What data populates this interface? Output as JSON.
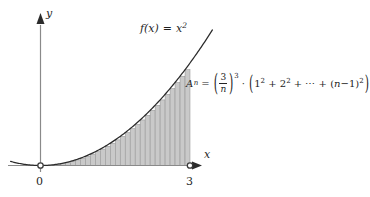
{
  "figure": {
    "background": "#ffffff",
    "axes": {
      "x_axis_label": "x",
      "y_axis_label": "y",
      "origin_label": "0",
      "right_tick_label": "3",
      "axis_color": "#8a8a8a",
      "tick_marker_style": "open-circle"
    },
    "curve": {
      "function_label_f": "f(x)",
      "function_label_eq": "=",
      "function_label_expr": "x",
      "function_label_exp": "2",
      "function_label_full": "f(x) = x²",
      "color": "#2a2a2a"
    },
    "riemann": {
      "fill_color": "#c9c9c9",
      "edge_color": "#8e8e8e",
      "rule": "left-endpoint",
      "bar_count": 30
    },
    "formula": {
      "lhs_var": "A",
      "lhs_sub": "n",
      "equals": "=",
      "frac_numerator": "3",
      "frac_denominator": "n",
      "frac_exponent": "3",
      "multiply_dot": "·",
      "term1_base": "1",
      "term1_exp": "2",
      "plus1": "+",
      "term2_base": "2",
      "term2_exp": "2",
      "plus2": "+",
      "ellipsis": "⋯",
      "plus3": "+",
      "term3_open": "(",
      "term3_var": "n",
      "term3_minus": "−",
      "term3_one": "1",
      "term3_close": ")",
      "term3_exp": "2",
      "full_text": "A_n = (3/n)^3 · (1² + 2² + ⋯ + (n−1)²)"
    }
  },
  "chart_data": {
    "type": "area",
    "title": "",
    "subtitle": "",
    "xlabel": "x",
    "ylabel": "y",
    "function": "f(x) = x^2",
    "grid": false,
    "legend": null,
    "xlim": [
      -0.6,
      3.45
    ],
    "ylim": [
      0,
      10.6
    ],
    "curve_x": [
      -0.6,
      -0.3,
      0,
      0.3,
      0.6,
      0.9,
      1.2,
      1.5,
      1.8,
      2.1,
      2.4,
      2.7,
      3.0,
      3.25
    ],
    "curve_y": [
      0.36,
      0.09,
      0,
      0.09,
      0.36,
      0.81,
      1.44,
      2.25,
      3.24,
      4.41,
      5.76,
      7.29,
      9.0,
      10.56
    ],
    "riemann_sum": {
      "rule": "left-endpoint",
      "interval": [
        0,
        3
      ],
      "n": 30,
      "bar_width": 0.1,
      "bar_left_edges": [
        0,
        0.1,
        0.2,
        0.3,
        0.4,
        0.5,
        0.6,
        0.7,
        0.8,
        0.9,
        1.0,
        1.1,
        1.2,
        1.3,
        1.4,
        1.5,
        1.6,
        1.7,
        1.8,
        1.9,
        2.0,
        2.1,
        2.2,
        2.3,
        2.4,
        2.5,
        2.6,
        2.7,
        2.8,
        2.9
      ],
      "bar_heights": [
        0,
        0.01,
        0.04,
        0.09,
        0.16,
        0.25,
        0.36,
        0.49,
        0.64,
        0.81,
        1.0,
        1.21,
        1.44,
        1.69,
        1.96,
        2.25,
        2.56,
        2.89,
        3.24,
        3.61,
        4.0,
        4.41,
        4.84,
        5.29,
        5.76,
        6.25,
        6.76,
        7.29,
        7.84,
        8.41
      ]
    },
    "annotations": [
      {
        "text": "f(x) = x²",
        "x": 2.45,
        "y": 10.2
      },
      {
        "text": "A_n = (3/n)^3 · (1² + 2² + ⋯ + (n−1)²)",
        "x": 3.35,
        "y": 6.4
      }
    ],
    "xticks": [
      0,
      3
    ],
    "xticklabels": [
      "0",
      "3"
    ],
    "yticks": [],
    "yticklabels": []
  }
}
